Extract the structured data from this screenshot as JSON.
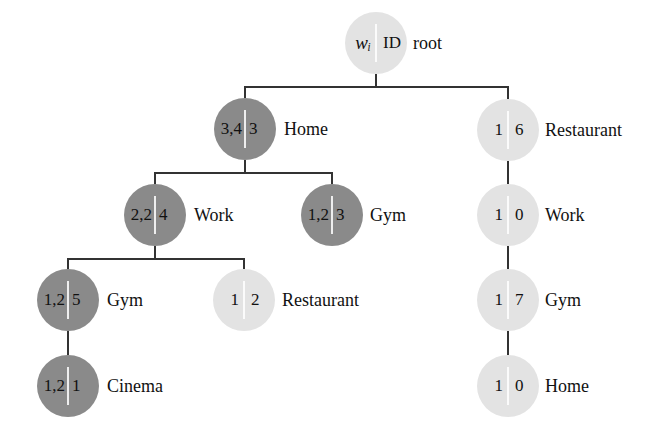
{
  "diagram": {
    "type": "tree",
    "legend": {
      "left_field": "w_i",
      "right_field": "ID"
    },
    "colors": {
      "dark_node": "#8a8a8a",
      "light_node": "#e3e3e3",
      "edge": "#333333"
    },
    "nodes": {
      "root": {
        "w": "wᵢ",
        "id": "ID",
        "label": "root",
        "shade": "light"
      },
      "home": {
        "w": "3,4",
        "id": "3",
        "label": "Home",
        "shade": "dark"
      },
      "restaurant_r": {
        "w": "1",
        "id": "6",
        "label": "Restaurant",
        "shade": "light"
      },
      "work_l": {
        "w": "2,2",
        "id": "4",
        "label": "Work",
        "shade": "dark"
      },
      "gym_m": {
        "w": "1,2",
        "id": "3",
        "label": "Gym",
        "shade": "dark"
      },
      "work_r": {
        "w": "1",
        "id": "0",
        "label": "Work",
        "shade": "light"
      },
      "gym_ll": {
        "w": "1,2",
        "id": "5",
        "label": "Gym",
        "shade": "dark"
      },
      "restaurant_m": {
        "w": "1",
        "id": "2",
        "label": "Restaurant",
        "shade": "light"
      },
      "gym_r": {
        "w": "1",
        "id": "7",
        "label": "Gym",
        "shade": "light"
      },
      "cinema": {
        "w": "1,2",
        "id": "1",
        "label": "Cinema",
        "shade": "dark"
      },
      "home_r": {
        "w": "1",
        "id": "0",
        "label": "Home",
        "shade": "light"
      }
    },
    "edges": [
      [
        "root",
        "home"
      ],
      [
        "root",
        "restaurant_r"
      ],
      [
        "home",
        "work_l"
      ],
      [
        "home",
        "gym_m"
      ],
      [
        "restaurant_r",
        "work_r"
      ],
      [
        "work_l",
        "gym_ll"
      ],
      [
        "work_l",
        "restaurant_m"
      ],
      [
        "work_r",
        "gym_r"
      ],
      [
        "gym_ll",
        "cinema"
      ],
      [
        "gym_r",
        "home_r"
      ]
    ]
  }
}
